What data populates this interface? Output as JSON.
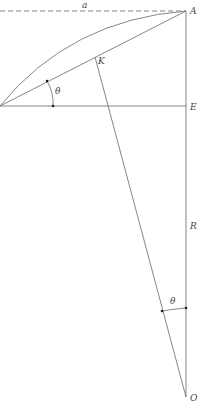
{
  "diagram": {
    "type": "geometry",
    "labels": {
      "a": "a",
      "A": "A",
      "K": "K",
      "E": "E",
      "R": "R",
      "O": "O",
      "theta_top": "θ",
      "theta_bottom": "θ"
    },
    "points": {
      "A": [
        186,
        11
      ],
      "E": [
        186,
        106
      ],
      "O": [
        186,
        397
      ],
      "K": [
        95,
        57
      ],
      "left_vertex": [
        0,
        106
      ]
    },
    "colors": {
      "line": "#777777",
      "text": "#444444",
      "background": "#ffffff"
    }
  }
}
